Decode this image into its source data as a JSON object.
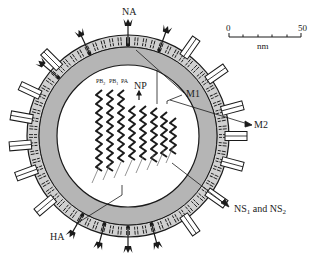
{
  "labels": {
    "na": "NA",
    "ha": "HA",
    "m1": "M1",
    "m2": "M2",
    "np": "NP",
    "pb2": "PB",
    "pb2_sub": "2",
    "pb1": "PB",
    "pb1_sub": "1",
    "pa": "PA",
    "ns_pre": "NS",
    "ns1_sub": "1",
    "ns_mid": " and NS",
    "ns2_sub": "2"
  },
  "scale_bar": {
    "start": "0",
    "end": "50",
    "unit": "nm"
  },
  "colors": {
    "outline": "#1a1a1a",
    "matrix_gray": "#b5b5b5",
    "envelope_gray": "#d0d0d0",
    "background": "#ffffff"
  }
}
